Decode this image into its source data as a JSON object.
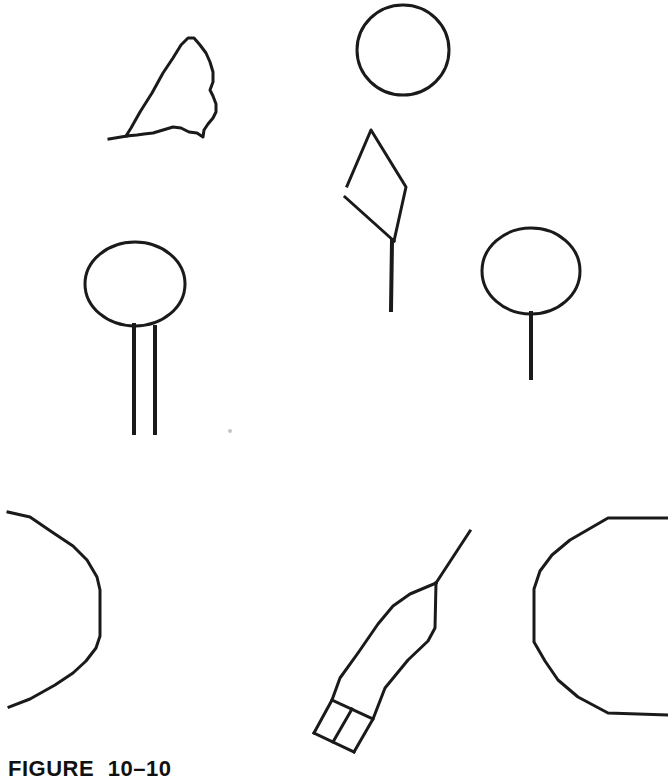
{
  "page": {
    "background": "#ffffff",
    "ink": "#1a1a1a",
    "width": 668,
    "height": 784
  },
  "figure": {
    "caption": "FIGURE 10–10",
    "shapes": [
      {
        "name": "irregular-blob-outline",
        "type": "polygon",
        "w": 3,
        "points": [
          [
            126,
            136
          ],
          [
            131,
            128
          ],
          [
            140,
            112
          ],
          [
            152,
            93
          ],
          [
            163,
            73
          ],
          [
            173,
            58
          ],
          [
            181,
            45
          ],
          [
            188,
            38
          ],
          [
            194,
            38
          ],
          [
            200,
            45
          ],
          [
            206,
            53
          ],
          [
            210,
            62
          ],
          [
            213,
            72
          ],
          [
            213,
            82
          ],
          [
            210,
            90
          ],
          [
            213,
            96
          ],
          [
            216,
            104
          ],
          [
            216,
            112
          ],
          [
            213,
            118
          ],
          [
            208,
            124
          ],
          [
            204,
            130
          ],
          [
            203,
            137
          ],
          [
            197,
            133
          ],
          [
            189,
            132
          ],
          [
            181,
            128
          ],
          [
            173,
            127
          ],
          [
            163,
            130
          ],
          [
            153,
            133
          ],
          [
            144,
            134
          ],
          [
            137,
            135
          ]
        ]
      },
      {
        "name": "irregular-blob-tail",
        "type": "line",
        "w": 3,
        "points": [
          [
            109,
            139
          ],
          [
            127,
            136
          ]
        ]
      },
      {
        "name": "top-circle",
        "type": "ellipse",
        "w": 3,
        "cx": 403,
        "cy": 50,
        "rx": 46,
        "ry": 45
      },
      {
        "name": "kite-outline",
        "type": "polyline",
        "w": 3,
        "points": [
          [
            347,
            186
          ],
          [
            371,
            130
          ],
          [
            406,
            187
          ],
          [
            394,
            241
          ]
        ]
      },
      {
        "name": "kite-lower-left-edge",
        "type": "line",
        "w": 3,
        "points": [
          [
            345,
            197
          ],
          [
            394,
            241
          ]
        ]
      },
      {
        "name": "kite-string",
        "type": "line",
        "w": 4,
        "points": [
          [
            392,
            241
          ],
          [
            391,
            310
          ]
        ]
      },
      {
        "name": "left-balloon-circle",
        "type": "ellipse",
        "w": 3,
        "cx": 135,
        "cy": 284,
        "rx": 50,
        "ry": 42
      },
      {
        "name": "left-balloon-stick-left",
        "type": "line",
        "w": 4,
        "points": [
          [
            134,
            325
          ],
          [
            134,
            433
          ]
        ]
      },
      {
        "name": "left-balloon-stick-right",
        "type": "line",
        "w": 4,
        "points": [
          [
            155,
            327
          ],
          [
            155,
            433
          ]
        ]
      },
      {
        "name": "right-balloon-circle",
        "type": "ellipse",
        "w": 3,
        "cx": 531,
        "cy": 271,
        "rx": 49,
        "ry": 43
      },
      {
        "name": "right-balloon-stick",
        "type": "line",
        "w": 4,
        "points": [
          [
            531,
            313
          ],
          [
            531,
            378
          ]
        ]
      },
      {
        "name": "bottom-left-partial-polygon",
        "type": "polyline",
        "w": 3,
        "points": [
          [
            8,
            512
          ],
          [
            30,
            517
          ],
          [
            52,
            532
          ],
          [
            73,
            546
          ],
          [
            87,
            560
          ],
          [
            97,
            577
          ],
          [
            100,
            590
          ],
          [
            100,
            636
          ],
          [
            96,
            648
          ],
          [
            86,
            661
          ],
          [
            73,
            673
          ],
          [
            55,
            685
          ],
          [
            30,
            699
          ],
          [
            9,
            707
          ]
        ]
      },
      {
        "name": "pencil-needle-line",
        "type": "line",
        "w": 3,
        "points": [
          [
            470,
            531
          ],
          [
            436,
            583
          ]
        ]
      },
      {
        "name": "pencil-left-edge",
        "type": "polyline",
        "w": 3,
        "points": [
          [
            436,
            583
          ],
          [
            410,
            594
          ],
          [
            393,
            606
          ],
          [
            378,
            624
          ],
          [
            358,
            653
          ],
          [
            340,
            678
          ],
          [
            332,
            700
          ],
          [
            314,
            733
          ]
        ]
      },
      {
        "name": "pencil-right-edge",
        "type": "polyline",
        "w": 3,
        "points": [
          [
            436,
            583
          ],
          [
            435,
            628
          ],
          [
            428,
            641
          ],
          [
            408,
            660
          ],
          [
            385,
            688
          ],
          [
            373,
            719
          ],
          [
            354,
            752
          ]
        ]
      },
      {
        "name": "pencil-band-top-line",
        "type": "line",
        "w": 3,
        "points": [
          [
            332,
            700
          ],
          [
            373,
            719
          ]
        ]
      },
      {
        "name": "pencil-band-divider",
        "type": "line",
        "w": 3,
        "points": [
          [
            352,
            709
          ],
          [
            333,
            742
          ]
        ]
      },
      {
        "name": "pencil-end-cap",
        "type": "line",
        "w": 3,
        "points": [
          [
            314,
            733
          ],
          [
            354,
            752
          ]
        ]
      },
      {
        "name": "bottom-right-partial-polygon",
        "type": "polyline",
        "w": 3,
        "points": [
          [
            668,
            518
          ],
          [
            608,
            518
          ],
          [
            570,
            540
          ],
          [
            552,
            555
          ],
          [
            540,
            571
          ],
          [
            534,
            589
          ],
          [
            534,
            642
          ],
          [
            545,
            661
          ],
          [
            558,
            680
          ],
          [
            578,
            697
          ],
          [
            608,
            713
          ],
          [
            668,
            715
          ]
        ]
      },
      {
        "name": "scan-speck",
        "type": "dot",
        "cx": 230,
        "cy": 431,
        "r": 2,
        "color": "#c4c4c4"
      }
    ]
  }
}
